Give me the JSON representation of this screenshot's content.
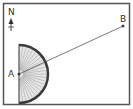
{
  "diagram": {
    "north_label": "N",
    "point_a_label": "A",
    "point_b_label": "B",
    "colors": {
      "frame": "#555555",
      "protractor_rim": "#3a3a3a",
      "protractor_fill": "#e6e6e6",
      "ticks": "#888888",
      "line": "#555555"
    }
  }
}
